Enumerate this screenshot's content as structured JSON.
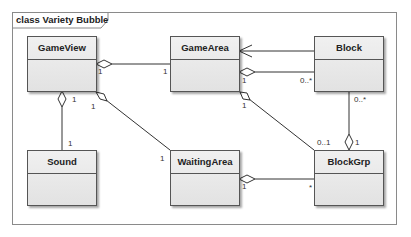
{
  "diagram": {
    "frame_title": "class Variety Bubble",
    "classes": [
      {
        "id": "gameview",
        "name": "GameView"
      },
      {
        "id": "gamearea",
        "name": "GameArea"
      },
      {
        "id": "block",
        "name": "Block"
      },
      {
        "id": "sound",
        "name": "Sound"
      },
      {
        "id": "waitingarea",
        "name": "WaitingArea"
      },
      {
        "id": "blockgrp",
        "name": "BlockGrp"
      }
    ],
    "relations": [
      {
        "from": "GameView",
        "to": "GameArea",
        "type": "aggregation",
        "whole": "GameView",
        "whole_mult": "1",
        "part_mult": "1"
      },
      {
        "from": "GameView",
        "to": "Sound",
        "type": "aggregation",
        "whole": "GameView",
        "whole_mult": "1",
        "part_mult": "1"
      },
      {
        "from": "GameView",
        "to": "WaitingArea",
        "type": "aggregation",
        "whole": "GameView",
        "whole_mult": "1",
        "part_mult": "1"
      },
      {
        "from": "Block",
        "to": "GameArea",
        "type": "association-navigable",
        "arrow_at": "GameArea"
      },
      {
        "from": "GameArea",
        "to": "Block",
        "type": "aggregation",
        "whole": "GameArea",
        "whole_mult": "1",
        "part_mult": "0..*"
      },
      {
        "from": "GameArea",
        "to": "BlockGrp",
        "type": "aggregation",
        "whole": "GameArea",
        "whole_mult": "1",
        "part_mult": "0..1"
      },
      {
        "from": "BlockGrp",
        "to": "Block",
        "type": "aggregation",
        "whole": "BlockGrp",
        "whole_mult": "1",
        "part_mult": "0..*"
      },
      {
        "from": "WaitingArea",
        "to": "BlockGrp",
        "type": "aggregation",
        "whole": "WaitingArea",
        "whole_mult": "1",
        "part_mult": "*"
      }
    ],
    "multiplicities": {
      "gv_ga_whole": "1",
      "gv_ga_part": "1",
      "gv_sound_whole": "1",
      "gv_sound_part": "1",
      "gv_wa_whole": "1",
      "gv_wa_part": "1",
      "ga_block_whole": "1",
      "ga_block_part": "0..*",
      "ga_bg_whole": "1",
      "ga_bg_part": "0..1",
      "bg_block_whole": "1",
      "bg_block_part": "0..*",
      "wa_bg_whole": "1",
      "wa_bg_part": "*"
    },
    "colors": {
      "line": "#333333",
      "class_fill": "#e8e8e8",
      "frame": "#8a8a8a"
    }
  }
}
